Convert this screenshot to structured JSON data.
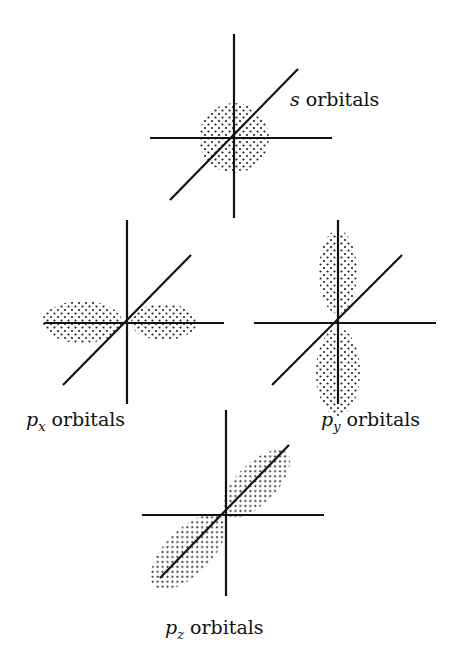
{
  "diagrams": [
    {
      "id": "s",
      "label_var": "s",
      "label_sub": "",
      "label_text": " orbitals",
      "center": [
        234,
        137
      ],
      "shape": "sphere"
    },
    {
      "id": "px",
      "label_var": "p",
      "label_sub": "x",
      "label_text": " orbitals",
      "center": [
        127,
        322
      ],
      "shape": "x-lobes"
    },
    {
      "id": "py",
      "label_var": "p",
      "label_sub": "y",
      "label_text": " orbitals",
      "center": [
        338,
        322
      ],
      "shape": "y-lobes"
    },
    {
      "id": "pz",
      "label_var": "p",
      "label_sub": "z",
      "label_text": " orbitals",
      "center": [
        226,
        514
      ],
      "shape": "z-lobes"
    }
  ],
  "colors": {
    "line": "#111111",
    "dots": "#222222",
    "background": "#ffffff"
  }
}
